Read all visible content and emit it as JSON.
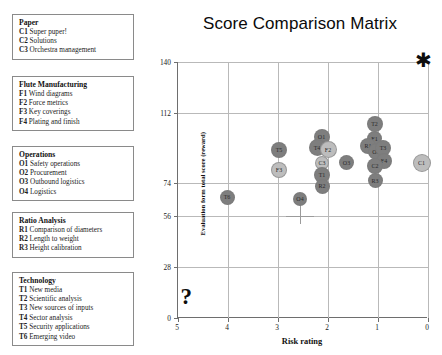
{
  "legend_panels": [
    {
      "title": "Paper",
      "items": [
        {
          "code": "C1",
          "label": "Super puper!"
        },
        {
          "code": "C2",
          "label": "Solutions"
        },
        {
          "code": "C3",
          "label": "Orchestra management"
        }
      ]
    },
    {
      "title": "Flute Manufacturing",
      "items": [
        {
          "code": "F1",
          "label": "Wind diagrams"
        },
        {
          "code": "F2",
          "label": "Force metrics"
        },
        {
          "code": "F3",
          "label": "Key coverings"
        },
        {
          "code": "F4",
          "label": "Plating and finish"
        }
      ]
    },
    {
      "title": "Operations",
      "items": [
        {
          "code": "O1",
          "label": "Safety operations"
        },
        {
          "code": "O2",
          "label": "Procurement"
        },
        {
          "code": "O3",
          "label": "Outbound logistics"
        },
        {
          "code": "O4",
          "label": "Logistics"
        }
      ]
    },
    {
      "title": "Ratio Analysis",
      "items": [
        {
          "code": "R1",
          "label": "Comparison of diameters"
        },
        {
          "code": "R2",
          "label": "Length to weight"
        },
        {
          "code": "R3",
          "label": "Height calibration"
        }
      ]
    },
    {
      "title": "Technology",
      "items": [
        {
          "code": "T1",
          "label": "New media"
        },
        {
          "code": "T2",
          "label": "Scientific analysis"
        },
        {
          "code": "T3",
          "label": "New sources of inputs"
        },
        {
          "code": "T4",
          "label": "Sector analysis"
        },
        {
          "code": "T5",
          "label": "Security applications"
        },
        {
          "code": "T6",
          "label": "Emerging video"
        }
      ]
    }
  ],
  "chart_data": {
    "type": "scatter",
    "title": "Score Comparison Matrix",
    "xlabel": "Risk rating",
    "ylabel": "Evaluation form total score (reward)",
    "xlim": [
      5,
      0
    ],
    "ylim": [
      0,
      140
    ],
    "x_reversed": true,
    "grid": true,
    "legend": "left-panels",
    "xticks": [
      5,
      4,
      3,
      2,
      1,
      0
    ],
    "yticks": [
      0,
      28,
      56,
      74,
      112,
      140
    ],
    "points": [
      {
        "label": "T6",
        "x": 4.02,
        "y": 66,
        "r": 7.5,
        "shade": "dark"
      },
      {
        "label": "T5",
        "x": 2.98,
        "y": 92,
        "r": 8.0,
        "shade": "dark"
      },
      {
        "label": "F3",
        "x": 2.98,
        "y": 81,
        "r": 8.0,
        "shade": "light"
      },
      {
        "label": "O4",
        "x": 2.56,
        "y": 65,
        "r": 7.0,
        "shade": "dark"
      },
      {
        "label": "O1",
        "x": 2.13,
        "y": 99,
        "r": 8.0,
        "shade": "dark"
      },
      {
        "label": "T4",
        "x": 2.22,
        "y": 93,
        "r": 8.5,
        "shade": "dark"
      },
      {
        "label": "F2",
        "x": 2.0,
        "y": 92,
        "r": 8.5,
        "shade": "light"
      },
      {
        "label": "C3",
        "x": 2.12,
        "y": 85,
        "r": 7.0,
        "shade": "light"
      },
      {
        "label": "T1",
        "x": 2.12,
        "y": 78,
        "r": 8.0,
        "shade": "dark"
      },
      {
        "label": "R2",
        "x": 2.12,
        "y": 72,
        "r": 7.5,
        "shade": "dark"
      },
      {
        "label": "O3",
        "x": 1.63,
        "y": 85,
        "r": 7.5,
        "shade": "dark"
      },
      {
        "label": "T2",
        "x": 1.07,
        "y": 106,
        "r": 8.0,
        "shade": "dark"
      },
      {
        "label": "F1",
        "x": 1.07,
        "y": 98,
        "r": 7.5,
        "shade": "dark"
      },
      {
        "label": "R1",
        "x": 1.2,
        "y": 94,
        "r": 8.0,
        "shade": "dark"
      },
      {
        "label": "O2",
        "x": 1.04,
        "y": 91,
        "r": 8.5,
        "shade": "dark"
      },
      {
        "label": "T3",
        "x": 0.9,
        "y": 93,
        "r": 8.0,
        "shade": "dark"
      },
      {
        "label": "F4",
        "x": 0.88,
        "y": 86,
        "r": 8.0,
        "shade": "dark"
      },
      {
        "label": "C2",
        "x": 1.06,
        "y": 83,
        "r": 8.0,
        "shade": "dark"
      },
      {
        "label": "R3",
        "x": 1.06,
        "y": 75,
        "r": 7.5,
        "shade": "dark"
      },
      {
        "label": "C1",
        "x": 0.13,
        "y": 85,
        "r": 9.0,
        "shade": "light"
      }
    ],
    "annotations": [
      {
        "name": "star-marker",
        "glyph": "✱",
        "x": 0.1,
        "y": 140
      },
      {
        "name": "question-marker",
        "glyph": "?",
        "x": 4.85,
        "y": 7
      },
      {
        "name": "crosshair",
        "x": 2.56,
        "y": 56
      }
    ],
    "colors": {
      "bubble_dark": "#7e7e7e",
      "bubble_light": "#bdbdbd",
      "grid": "#b9b9b9",
      "axis": "#6e6e6e",
      "text": "#1a1a1a"
    }
  }
}
